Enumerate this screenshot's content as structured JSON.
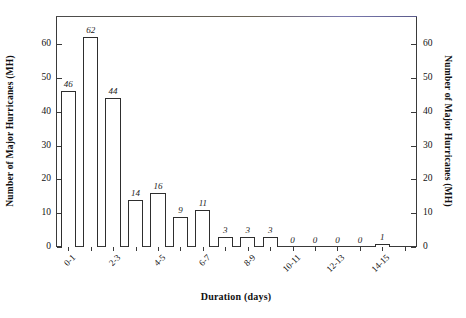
{
  "chart_data": {
    "type": "bar",
    "title": "",
    "subtitle": "",
    "xlabel": "Duration (days)",
    "ylabel": "Number of Major Hurricanes  (MH)",
    "ylabel_right": "Number of Major Hurricanes  (MH)",
    "categories": [
      "0-1",
      "1-2",
      "2-3",
      "3-4",
      "4-5",
      "5-6",
      "6-7",
      "7-8",
      "8-9",
      "9-10",
      "10-11",
      "11-12",
      "12-13",
      "13-14",
      "14-15",
      "15-16"
    ],
    "values": [
      46,
      62,
      44,
      14,
      16,
      9,
      11,
      3,
      3,
      3,
      0,
      0,
      0,
      0,
      1,
      0
    ],
    "bar_labels": [
      "46",
      "62",
      "44",
      "14",
      "16",
      "9",
      "11",
      "3",
      "3",
      "3",
      "0",
      "0",
      "0",
      "0",
      "1",
      ""
    ],
    "xtick_labels": [
      "0-1",
      "",
      "2-3",
      "",
      "4-5",
      "",
      "6-7",
      "",
      "8-9",
      "",
      "10-11",
      "",
      "12-13",
      "",
      "14-15",
      ""
    ],
    "ylim": [
      0,
      68
    ],
    "yticks": [
      0,
      10,
      20,
      30,
      40,
      50,
      60
    ],
    "ytick_labels": [
      "0",
      "10",
      "20",
      "30",
      "40",
      "50",
      "60"
    ],
    "grid": false,
    "legend": false,
    "legend_position": "none",
    "frame": true,
    "colors": {
      "bar_face": "#ffffff",
      "bar_edge": "#2e2e2e",
      "axis": "#3a3a3a",
      "text": "#111111",
      "background": "#ffffff"
    }
  }
}
